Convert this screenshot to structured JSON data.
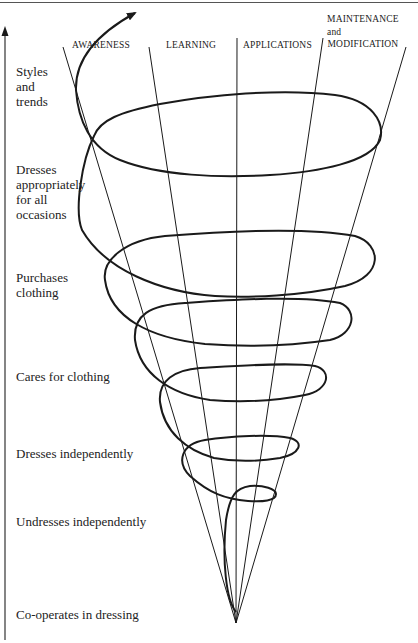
{
  "diagram": {
    "type": "cone-spiral",
    "columns": [
      {
        "id": "awareness",
        "label": "AWARENESS"
      },
      {
        "id": "learning",
        "label": "LEARNING"
      },
      {
        "id": "applications",
        "label": "APPLICATIONS"
      },
      {
        "id": "maintenance",
        "label_line1": "MAINTENANCE",
        "label_line2": "and",
        "label_line3": "MODIFICATION"
      }
    ],
    "stages": [
      {
        "id": "styles",
        "line1": "Styles",
        "line2": "and",
        "line3": "trends"
      },
      {
        "id": "occasions",
        "line1": "Dresses",
        "line2": "appropriately",
        "line3": "for all",
        "line4": "occasions"
      },
      {
        "id": "purchases",
        "line1": "Purchases",
        "line2": "clothing"
      },
      {
        "id": "cares",
        "line1": "Cares for clothing"
      },
      {
        "id": "dresses",
        "line1": "Dresses independently"
      },
      {
        "id": "undresses",
        "line1": "Undresses independently"
      },
      {
        "id": "cooperates",
        "line1": "Co-operates in dressing"
      }
    ],
    "axis_arrow": "up-arrow",
    "spiral_arrow": "spiral-end-arrow",
    "colors": {
      "line": "#1a1a1a",
      "background": "#ffffff"
    }
  }
}
